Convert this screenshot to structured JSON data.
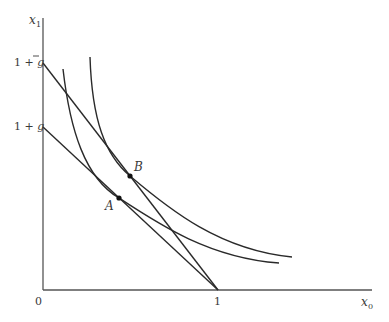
{
  "diagram": {
    "type": "indifference-curves-budget-lines",
    "axes": {
      "x_label": "x",
      "x_sub": "0",
      "y_label": "x",
      "y_sub": "1",
      "origin_label": "0",
      "x_tick_label": "1"
    },
    "y_ticks": [
      {
        "prefix": "1 + ",
        "var": "g",
        "overline": true,
        "name": "1 + g-bar"
      },
      {
        "prefix": "1 + ",
        "var": "g",
        "overline": false,
        "name": "1 + g"
      }
    ],
    "points": [
      {
        "label": "A",
        "x": 119,
        "y": 198
      },
      {
        "label": "B",
        "x": 130,
        "y": 176
      }
    ],
    "lines": [
      {
        "name": "steep-budget-line",
        "from": "1 + g-bar",
        "to": "1"
      },
      {
        "name": "flat-budget-line",
        "from": "1 + g",
        "to": "1"
      }
    ],
    "curves": [
      {
        "name": "inner-indifference-curve",
        "tangent_point": "A"
      },
      {
        "name": "outer-indifference-curve",
        "tangent_point": "B"
      }
    ],
    "colors": {
      "line": "#2a2a2a",
      "axis": "#555555",
      "text": "#3a3a3a"
    }
  }
}
